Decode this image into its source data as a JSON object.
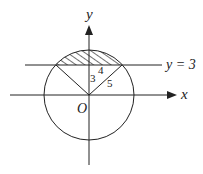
{
  "diagram": {
    "type": "geometry",
    "axes": {
      "x_label": "x",
      "y_label": "y",
      "origin_label": "O"
    },
    "line": {
      "label": "y = 3"
    },
    "triangle_labels": {
      "vertical_leg": "3",
      "horizontal_leg": "4",
      "hypotenuse": "5"
    },
    "shaded_region": "circular segment above y = 3",
    "colors": {
      "stroke": "#222222",
      "background": "#ffffff"
    }
  }
}
